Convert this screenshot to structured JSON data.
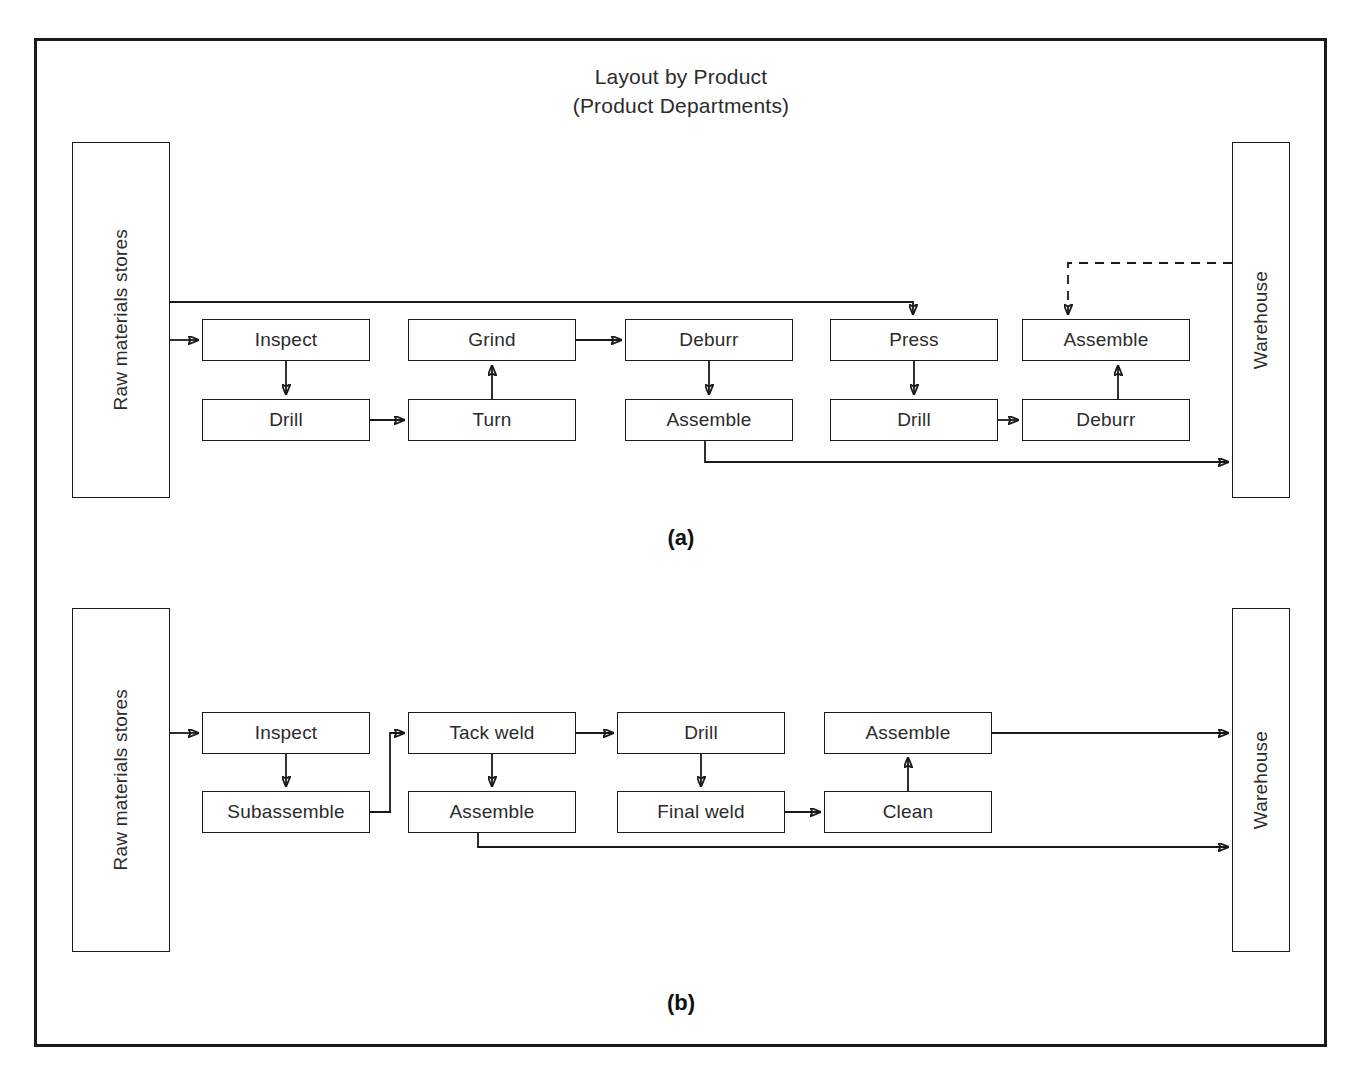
{
  "figure": {
    "title_line1": "Layout by Product",
    "title_line2": "(Product Departments)",
    "panel_a_label": "(a)",
    "panel_b_label": "(b)",
    "line_color": "#1a1a1a",
    "text_color": "#2b2b2b",
    "background": "#ffffff"
  },
  "panel_a": {
    "id": "(a)",
    "source": {
      "label": "Raw materials stores",
      "orientation": "vertical"
    },
    "sink": {
      "label": "Warehouse",
      "orientation": "vertical"
    },
    "top_row": [
      {
        "label": "Inspect"
      },
      {
        "label": "Grind"
      },
      {
        "label": "Deburr"
      },
      {
        "label": "Press"
      },
      {
        "label": "Assemble"
      }
    ],
    "bottom_row": [
      {
        "label": "Drill"
      },
      {
        "label": "Turn"
      },
      {
        "label": "Assemble"
      },
      {
        "label": "Drill"
      },
      {
        "label": "Deburr"
      }
    ],
    "flows": [
      {
        "from": "Raw materials stores",
        "to": "Inspect",
        "style": "solid"
      },
      {
        "from": "Inspect",
        "to": "Drill",
        "style": "solid"
      },
      {
        "from": "Drill",
        "to": "Turn",
        "style": "solid"
      },
      {
        "from": "Turn",
        "to": "Grind",
        "style": "solid"
      },
      {
        "from": "Grind",
        "to": "Deburr",
        "style": "solid"
      },
      {
        "from": "Deburr",
        "to": "Assemble",
        "style": "solid"
      },
      {
        "from": "Assemble",
        "to": "Warehouse",
        "style": "solid"
      },
      {
        "from": "Raw materials stores",
        "to": "Press",
        "style": "solid"
      },
      {
        "from": "Press",
        "to": "Drill",
        "style": "solid"
      },
      {
        "from": "Drill",
        "to": "Deburr",
        "style": "solid"
      },
      {
        "from": "Deburr",
        "to": "Assemble",
        "style": "solid"
      },
      {
        "from": "Warehouse",
        "to": "Assemble",
        "style": "dashed"
      }
    ]
  },
  "panel_b": {
    "id": "(b)",
    "source": {
      "label": "Raw materials stores",
      "orientation": "vertical"
    },
    "sink": {
      "label": "Warehouse",
      "orientation": "vertical"
    },
    "top_row": [
      {
        "label": "Inspect"
      },
      {
        "label": "Tack weld"
      },
      {
        "label": "Drill"
      },
      {
        "label": "Assemble"
      }
    ],
    "bottom_row": [
      {
        "label": "Subassemble"
      },
      {
        "label": "Assemble"
      },
      {
        "label": "Final weld"
      },
      {
        "label": "Clean"
      }
    ],
    "flows": [
      {
        "from": "Raw materials stores",
        "to": "Inspect",
        "style": "solid"
      },
      {
        "from": "Inspect",
        "to": "Subassemble",
        "style": "solid"
      },
      {
        "from": "Subassemble",
        "to": "Tack weld",
        "style": "solid"
      },
      {
        "from": "Tack weld",
        "to": "Assemble",
        "style": "solid"
      },
      {
        "from": "Tack weld",
        "to": "Drill",
        "style": "solid"
      },
      {
        "from": "Drill",
        "to": "Final weld",
        "style": "solid"
      },
      {
        "from": "Final weld",
        "to": "Clean",
        "style": "solid"
      },
      {
        "from": "Clean",
        "to": "Assemble",
        "style": "solid"
      },
      {
        "from": "Assemble",
        "to": "Warehouse",
        "style": "solid"
      }
    ]
  }
}
